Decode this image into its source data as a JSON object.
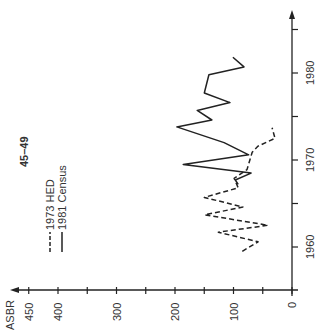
{
  "chart_data": {
    "type": "line",
    "orientation": "rotated-90-ccw",
    "title": "45–49",
    "xlabel": "",
    "ylabel": "ASBR",
    "ylim": [
      0,
      460
    ],
    "y_ticks": [
      0,
      100,
      200,
      300,
      400,
      450
    ],
    "y_minor_ticks": [
      50,
      150,
      250,
      350
    ],
    "xlim": [
      1958,
      1986
    ],
    "x_ticks": [
      1960,
      1970,
      1980
    ],
    "x_minor_ticks": [
      1965,
      1975,
      1985
    ],
    "grid": false,
    "legend_position": "upper-left (rotated)",
    "series": [
      {
        "name": "1973 HED",
        "style": "dashed",
        "x": [
          1959.5,
          1960.6,
          1961.7,
          1962.5,
          1963.7,
          1964.6,
          1965.7,
          1966.8,
          1967.9,
          1968.9,
          1970.9,
          1971.6,
          1972.5,
          1973.7
        ],
        "values": [
          85,
          58,
          126,
          41,
          149,
          84,
          150,
          92,
          99,
          77,
          68,
          58,
          29,
          34
        ]
      },
      {
        "name": "1981 Census",
        "style": "solid",
        "x": [
          1967.2,
          1967.7,
          1968.5,
          1969.5,
          1970.6,
          1972.0,
          1973.8,
          1974.6,
          1975.7,
          1976.6,
          1977.7,
          1979.8,
          1980.7,
          1981.8
        ],
        "values": [
          92,
          97,
          70,
          186,
          74,
          116,
          197,
          137,
          162,
          106,
          150,
          142,
          82,
          101
        ]
      }
    ]
  },
  "labels": {
    "title": "45–49",
    "ylabel": "ASBR",
    "legend": [
      "1973 HED",
      "1981 Census"
    ],
    "y_tick_labels": [
      "0",
      "100",
      "200",
      "300",
      "400",
      "450"
    ],
    "x_tick_labels": [
      "1960",
      "1970",
      "1980"
    ]
  }
}
